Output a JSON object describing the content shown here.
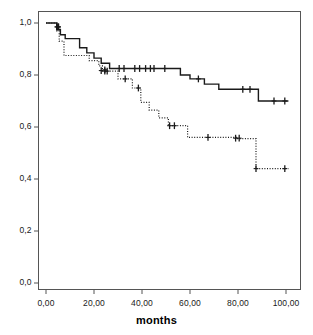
{
  "chart_data": {
    "type": "line",
    "title": "",
    "subtitle": "",
    "xlabel": "months",
    "ylabel": "",
    "xlim": [
      0,
      104
    ],
    "ylim": [
      0.0,
      1.0
    ],
    "grid": false,
    "legend_position": "none",
    "x_ticks": [
      0,
      20,
      40,
      60,
      80,
      100
    ],
    "x_tick_labels": [
      "0,00",
      "20,00",
      "40,00",
      "60,00",
      "80,00",
      "100,00"
    ],
    "y_ticks": [
      0.0,
      0.2,
      0.4,
      0.6,
      0.8,
      1.0
    ],
    "y_tick_labels": [
      "0,0",
      "0,2",
      "0,4",
      "0,6",
      "0,8",
      "1,0"
    ],
    "series": [
      {
        "name": "group-solid",
        "style": "solid",
        "color": "#1a1a1a",
        "step": "post",
        "points": [
          [
            0,
            1.0
          ],
          [
            4.5,
            1.0
          ],
          [
            4.5,
            0.975
          ],
          [
            6,
            0.975
          ],
          [
            6,
            0.955
          ],
          [
            8,
            0.955
          ],
          [
            8,
            0.94
          ],
          [
            14,
            0.94
          ],
          [
            14,
            0.905
          ],
          [
            17,
            0.905
          ],
          [
            17,
            0.885
          ],
          [
            20,
            0.885
          ],
          [
            20,
            0.865
          ],
          [
            23,
            0.865
          ],
          [
            23,
            0.845
          ],
          [
            26.5,
            0.845
          ],
          [
            26.5,
            0.825
          ],
          [
            56,
            0.825
          ],
          [
            56,
            0.8
          ],
          [
            60,
            0.8
          ],
          [
            60,
            0.785
          ],
          [
            66,
            0.785
          ],
          [
            66,
            0.765
          ],
          [
            72,
            0.765
          ],
          [
            72,
            0.745
          ],
          [
            88.5,
            0.745
          ],
          [
            88.5,
            0.7
          ],
          [
            101,
            0.7
          ]
        ],
        "censor_marks": [
          [
            4.6,
            0.985
          ],
          [
            5.2,
            0.985
          ],
          [
            24.5,
            0.82
          ],
          [
            25.5,
            0.815
          ],
          [
            30.5,
            0.825
          ],
          [
            32.5,
            0.825
          ],
          [
            37,
            0.825
          ],
          [
            39,
            0.825
          ],
          [
            41.5,
            0.825
          ],
          [
            43.5,
            0.825
          ],
          [
            45,
            0.825
          ],
          [
            49.5,
            0.825
          ],
          [
            63.5,
            0.785
          ],
          [
            82,
            0.745
          ],
          [
            85,
            0.745
          ],
          [
            95,
            0.7
          ],
          [
            99.5,
            0.7
          ]
        ]
      },
      {
        "name": "group-dotted",
        "style": "dotted",
        "color": "#1a1a1a",
        "step": "post",
        "points": [
          [
            0,
            1.0
          ],
          [
            4.5,
            1.0
          ],
          [
            4.5,
            0.97
          ],
          [
            5.5,
            0.97
          ],
          [
            5.5,
            0.93
          ],
          [
            7.5,
            0.93
          ],
          [
            7.5,
            0.875
          ],
          [
            18,
            0.875
          ],
          [
            18,
            0.855
          ],
          [
            22,
            0.855
          ],
          [
            22,
            0.835
          ],
          [
            23.5,
            0.835
          ],
          [
            23.5,
            0.815
          ],
          [
            30,
            0.815
          ],
          [
            30,
            0.785
          ],
          [
            36,
            0.785
          ],
          [
            36,
            0.75
          ],
          [
            39.5,
            0.75
          ],
          [
            39.5,
            0.695
          ],
          [
            43,
            0.695
          ],
          [
            43,
            0.665
          ],
          [
            47,
            0.665
          ],
          [
            47,
            0.635
          ],
          [
            51,
            0.635
          ],
          [
            51,
            0.605
          ],
          [
            59,
            0.605
          ],
          [
            59,
            0.56
          ],
          [
            79.5,
            0.56
          ],
          [
            79.5,
            0.555
          ],
          [
            87.5,
            0.555
          ],
          [
            87.5,
            0.44
          ],
          [
            101,
            0.44
          ]
        ],
        "censor_marks": [
          [
            4.6,
            0.985
          ],
          [
            5.2,
            0.985
          ],
          [
            23,
            0.817
          ],
          [
            24.5,
            0.815
          ],
          [
            33,
            0.785
          ],
          [
            38.5,
            0.75
          ],
          [
            51.5,
            0.605
          ],
          [
            53.5,
            0.605
          ],
          [
            67.5,
            0.56
          ],
          [
            79,
            0.557
          ],
          [
            80.5,
            0.557
          ],
          [
            87.5,
            0.44
          ],
          [
            99.5,
            0.44
          ]
        ]
      }
    ]
  },
  "axes": {
    "frame_color": "#555555"
  }
}
